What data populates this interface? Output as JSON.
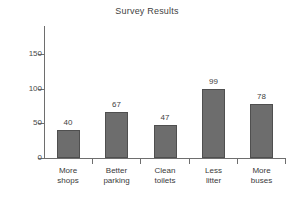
{
  "chart_data": {
    "type": "bar",
    "title": "Survey Results",
    "xlabel": "",
    "ylabel": "",
    "categories": [
      "More shops",
      "Better parking",
      "Clean toilets",
      "Less litter",
      "More buses"
    ],
    "category_lines": [
      [
        "More",
        "shops"
      ],
      [
        "Better",
        "parking"
      ],
      [
        "Clean",
        "toilets"
      ],
      [
        "Less",
        "litter"
      ],
      [
        "More",
        "buses"
      ]
    ],
    "values": [
      40,
      67,
      47,
      99,
      78
    ],
    "value_labels": [
      "40",
      "67",
      "47",
      "99",
      "78"
    ],
    "ylim": [
      0,
      150
    ],
    "yticks": [
      0,
      50,
      100,
      150
    ],
    "ytick_labels": [
      "0",
      "50",
      "100",
      "150"
    ],
    "grid": false,
    "legend": false,
    "bar_color": "#6d6d6d",
    "bar_edge_color": "#4f4f4f",
    "axis_color": "#6e6e6e",
    "text_color": "#3a3a3a",
    "background": "#ffffff"
  }
}
